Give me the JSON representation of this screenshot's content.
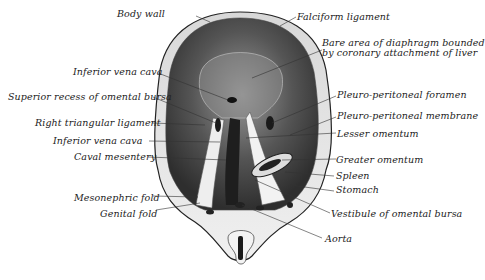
{
  "figure": {
    "colors": {
      "tissue_dark": "#3a3a3a",
      "tissue_mid": "#8a8a8a",
      "tissue_light": "#e6e6e6",
      "outline": "#222222",
      "background": "#ffffff"
    }
  },
  "labels": {
    "body_wall": "Body wall",
    "falciform_ligament": "Falciform ligament",
    "bare_area_line1": "Bare area of diaphragm bounded",
    "bare_area_line2": "by coronary attachment of liver",
    "inferior_vena_cava_upper": "Inferior vena cava",
    "superior_recess": "Superior recess of omental bursa",
    "right_triangular_ligament": "Right triangular ligament",
    "inferior_vena_cava_lower": "Inferior vena cava",
    "caval_mesentery": "Caval mesentery",
    "mesonephric_fold": "Mesonephric fold",
    "genital_fold": "Genital fold",
    "pleuro_peritoneal_foramen": "Pleuro-peritoneal foramen",
    "pleuro_peritoneal_membrane": "Pleuro-peritoneal membrane",
    "lesser_omentum": "Lesser omentum",
    "greater_omentum": "Greater omentum",
    "spleen": "Spleen",
    "stomach": "Stomach",
    "vestibule": "Vestibule of omental bursa",
    "aorta": "Aorta"
  }
}
